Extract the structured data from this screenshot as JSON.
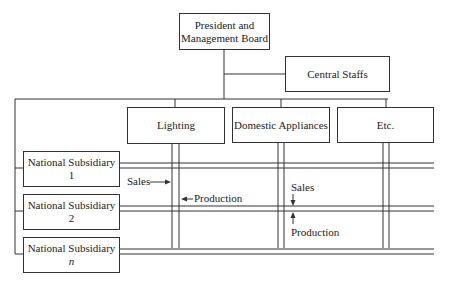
{
  "top": {
    "president": "President and Management Board",
    "president_line1": "President and",
    "president_line2": "Management Board",
    "central_staffs": "Central Staffs"
  },
  "divisions": [
    {
      "label": "Lighting"
    },
    {
      "label": "Domestic Appliances"
    },
    {
      "label": "Etc."
    }
  ],
  "subsidiaries": [
    {
      "label": "National Subsidiary",
      "index": "1"
    },
    {
      "label": "National Subsidiary",
      "index": "2"
    },
    {
      "label": "National Subsidiary",
      "index": "n"
    }
  ],
  "annotations": {
    "lighting_sales": "Sales",
    "lighting_production": "Production",
    "da_sales": "Sales",
    "da_production": "Production"
  }
}
